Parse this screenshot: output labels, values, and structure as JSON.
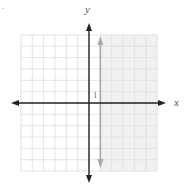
{
  "problem_mark": ".",
  "chart_data": {
    "type": "inequality-graph",
    "title": "",
    "xlabel": "x",
    "ylabel": "y",
    "xlim": [
      -6,
      6
    ],
    "ylim": [
      -6,
      6
    ],
    "grid": true,
    "grid_step": 1,
    "tick_labels": [
      {
        "axis": "x",
        "value": 1,
        "text": "1"
      }
    ],
    "boundary": {
      "type": "vertical-line",
      "x": 1,
      "style": "solid",
      "color": "#a8a8a8"
    },
    "shaded_region": {
      "inequality": "x >= 1",
      "side": "right",
      "color": "#f1f1f1"
    }
  },
  "colors": {
    "axis": "#222222",
    "grid": "#dcdcdc",
    "boundary": "#a8a8a8",
    "shade": "#f1f1f1"
  }
}
